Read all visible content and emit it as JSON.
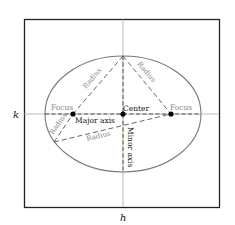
{
  "diagram": {
    "type": "ellipse-anatomy",
    "frame": {
      "x": 24,
      "y": 19,
      "width": 195,
      "height": 188
    },
    "axes": {
      "h": {
        "label": "h",
        "x": 123
      },
      "k": {
        "label": "k",
        "y": 114
      }
    },
    "ellipse": {
      "cx": 123,
      "cy": 114,
      "rx": 78,
      "ry": 58,
      "stroke": "#777777"
    },
    "points": {
      "left_focus": {
        "x": 73,
        "y": 114,
        "label": "Focus"
      },
      "right_focus": {
        "x": 171,
        "y": 114,
        "label": "Focus"
      },
      "center": {
        "x": 123,
        "y": 114,
        "label": "Center"
      },
      "top_vertex": {
        "x": 123,
        "y": 56
      },
      "lower_left_point": {
        "x": 54,
        "y": 142
      }
    },
    "labels": {
      "major_axis": "Major axis",
      "minor_axis": "Minor axis",
      "radius_top_left": "Radius",
      "radius_top_right": "Radius",
      "radius_lower_left": "Radius",
      "radius_bottom": "Radius",
      "focus_left": "Focus",
      "focus_right": "Focus",
      "center": "Center",
      "h": "h",
      "k": "k"
    },
    "colors": {
      "frame": "#222222",
      "axis_lines": "#aaaaaa",
      "ellipse": "#777777",
      "dashed": "#555555",
      "gray_text": "#888888",
      "black_text": "#111111"
    }
  }
}
